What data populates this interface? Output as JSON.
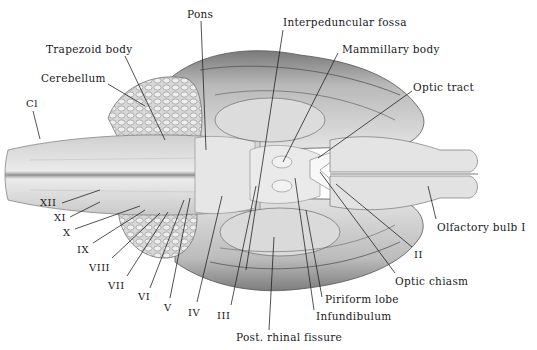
{
  "figure": {
    "background": "#ffffff",
    "ink_color": "#1a1a1a"
  },
  "labels": [
    {
      "id": "pons",
      "text": "Pons",
      "x": 187,
      "y": 9,
      "lx1": 201,
      "ly1": 21,
      "lx2": 206,
      "ly2": 150
    },
    {
      "id": "interpeduncular-fossa",
      "text": "Interpeduncular fossa",
      "x": 283,
      "y": 17,
      "lx1": 283,
      "ly1": 30,
      "lx2": 246,
      "ly2": 270
    },
    {
      "id": "trapezoid-body",
      "text": "Trapezoid body",
      "x": 46,
      "y": 44,
      "lx1": 125,
      "ly1": 56,
      "lx2": 165,
      "ly2": 140
    },
    {
      "id": "mammillary-body",
      "text": "Mammillary body",
      "x": 342,
      "y": 44,
      "lx1": 338,
      "ly1": 53,
      "lx2": 283,
      "ly2": 162
    },
    {
      "id": "cerebellum",
      "text": "Cerebellum",
      "x": 41,
      "y": 73,
      "lx1": 108,
      "ly1": 84,
      "lx2": 145,
      "ly2": 106
    },
    {
      "id": "optic-tract",
      "text": "Optic tract",
      "x": 413,
      "y": 82,
      "lx1": 412,
      "ly1": 91,
      "lx2": 318,
      "ly2": 158
    },
    {
      "id": "c1",
      "text": "Cl",
      "x": 26,
      "y": 99,
      "lx1": 33,
      "ly1": 111,
      "lx2": 40,
      "ly2": 139
    },
    {
      "id": "xii",
      "text": "XII",
      "x": 40,
      "y": 198,
      "lx1": 62,
      "ly1": 203,
      "lx2": 100,
      "ly2": 190
    },
    {
      "id": "xi",
      "text": "XI",
      "x": 54,
      "y": 213,
      "lx1": 70,
      "ly1": 217,
      "lx2": 100,
      "ly2": 202
    },
    {
      "id": "x",
      "text": "X",
      "x": 63,
      "y": 228,
      "lx1": 75,
      "ly1": 229,
      "lx2": 140,
      "ly2": 206
    },
    {
      "id": "ix",
      "text": "IX",
      "x": 77,
      "y": 245,
      "lx1": 93,
      "ly1": 243,
      "lx2": 145,
      "ly2": 210
    },
    {
      "id": "viii",
      "text": "VIII",
      "x": 89,
      "y": 263,
      "lx1": 112,
      "ly1": 258,
      "lx2": 160,
      "ly2": 213
    },
    {
      "id": "vii",
      "text": "VII",
      "x": 108,
      "y": 281,
      "lx1": 127,
      "ly1": 276,
      "lx2": 168,
      "ly2": 212
    },
    {
      "id": "vi",
      "text": "VI",
      "x": 138,
      "y": 292,
      "lx1": 150,
      "ly1": 288,
      "lx2": 184,
      "ly2": 200
    },
    {
      "id": "v",
      "text": "V",
      "x": 164,
      "y": 303,
      "lx1": 170,
      "ly1": 298,
      "lx2": 190,
      "ly2": 198
    },
    {
      "id": "iv",
      "text": "IV",
      "x": 188,
      "y": 308,
      "lx1": 197,
      "ly1": 302,
      "lx2": 222,
      "ly2": 196
    },
    {
      "id": "iii",
      "text": "III",
      "x": 217,
      "y": 311,
      "lx1": 231,
      "ly1": 305,
      "lx2": 256,
      "ly2": 186
    },
    {
      "id": "olfactory-bulb",
      "text": "Olfactory bulb  I",
      "x": 437,
      "y": 222,
      "lx1": 436,
      "ly1": 219,
      "lx2": 428,
      "ly2": 186
    },
    {
      "id": "ii",
      "text": "II",
      "x": 414,
      "y": 250,
      "lx1": 412,
      "ly1": 247,
      "lx2": 336,
      "ly2": 184
    },
    {
      "id": "optic-chiasm",
      "text": "Optic chiasm",
      "x": 395,
      "y": 276,
      "lx1": 395,
      "ly1": 273,
      "lx2": 320,
      "ly2": 172
    },
    {
      "id": "piriform-lobe",
      "text": "Piriform lobe",
      "x": 325,
      "y": 294,
      "lx1": 322,
      "ly1": 297,
      "lx2": 306,
      "ly2": 210
    },
    {
      "id": "infundibulum",
      "text": "Infundibulum",
      "x": 316,
      "y": 311,
      "lx1": 314,
      "ly1": 310,
      "lx2": 295,
      "ly2": 178
    },
    {
      "id": "post-rhinal-fissure",
      "text": "Post. rhinal fissure",
      "x": 236,
      "y": 332,
      "lx1": 269,
      "ly1": 330,
      "lx2": 274,
      "ly2": 237
    }
  ]
}
